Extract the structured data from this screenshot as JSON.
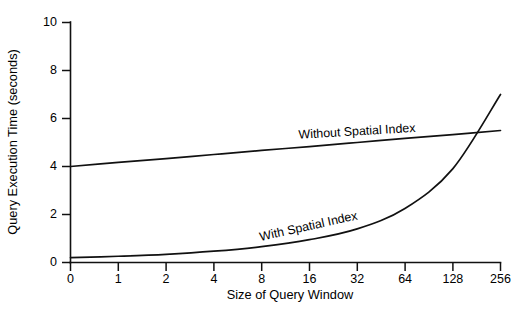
{
  "chart_data": {
    "type": "line",
    "title": "",
    "xlabel": "Size of Query Window",
    "ylabel": "Query Execution Time (seconds)",
    "x_tick_labels": [
      "0",
      "1",
      "2",
      "4",
      "8",
      "16",
      "32",
      "64",
      "128",
      "256"
    ],
    "y_tick_labels": [
      "0",
      "2",
      "4",
      "6",
      "8",
      "10"
    ],
    "x_tick_values": [
      0,
      1,
      2,
      4,
      8,
      16,
      32,
      64,
      128,
      256
    ],
    "y_tick_values": [
      0,
      2,
      4,
      6,
      8,
      10
    ],
    "ylim": [
      0,
      10
    ],
    "x_scale": "log-categorical-even-spacing",
    "grid": false,
    "legend": "inline-labels",
    "series": [
      {
        "name": "Without Spatial Index",
        "categories": [
          "0",
          "1",
          "2",
          "4",
          "8",
          "16",
          "32",
          "64",
          "128",
          "256"
        ],
        "values": [
          4.0,
          4.17,
          4.33,
          4.5,
          4.67,
          4.83,
          5.0,
          5.17,
          5.33,
          5.5
        ],
        "label_position_index": 6
      },
      {
        "name": "With Spatial Index",
        "categories": [
          "0",
          "1",
          "2",
          "4",
          "8",
          "16",
          "32",
          "64",
          "128",
          "256"
        ],
        "values": [
          0.2,
          0.26,
          0.34,
          0.47,
          0.66,
          0.95,
          1.4,
          2.25,
          3.9,
          7.0
        ],
        "label_position_index": 5
      }
    ],
    "annotations": [
      {
        "text": "Without Spatial Index",
        "x_category": "32",
        "y_value": 5.3,
        "rotation": -3.4
      },
      {
        "text": "With Spatial Index",
        "x_category": "16",
        "y_value": 1.35,
        "rotation": -12.5
      }
    ],
    "colors": {
      "line": "#111111",
      "axis": "#111111",
      "background": "#ffffff",
      "text": "#000000"
    }
  }
}
